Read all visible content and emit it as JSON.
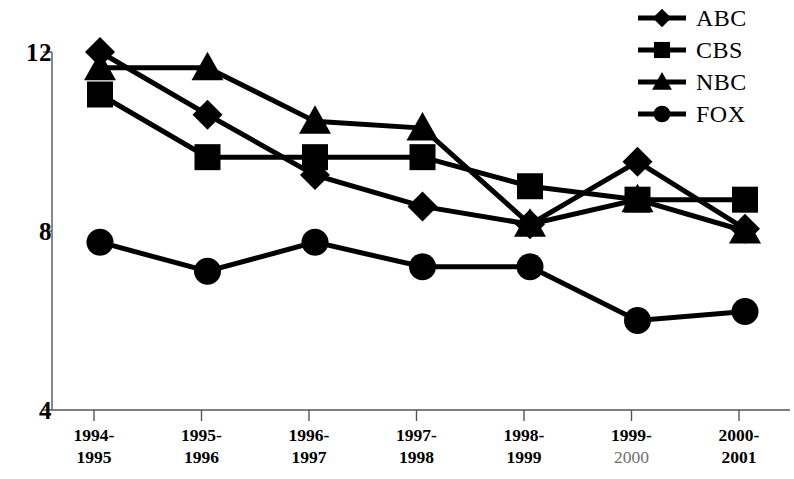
{
  "chart_data": {
    "type": "line",
    "title": "",
    "subtitle": "",
    "xlabel": "",
    "ylabel": "",
    "grid": false,
    "legend_position": "top-right",
    "ylim": [
      4,
      12
    ],
    "yticks": [
      4,
      8,
      12
    ],
    "ytick_labels": [
      "4",
      "8",
      "12"
    ],
    "categories": [
      "1994-1995",
      "1995-1996",
      "1996-1997",
      "1997-1998",
      "1998-1999",
      "1999-2000",
      "2000-2001"
    ],
    "category_lines": [
      {
        "line1": "1994-",
        "line2": "1995",
        "line2_light": false
      },
      {
        "line1": "1995-",
        "line2": "1996",
        "line2_light": false
      },
      {
        "line1": "1996-",
        "line2": "1997",
        "line2_light": false
      },
      {
        "line1": "1997-",
        "line2": "1998",
        "line2_light": false
      },
      {
        "line1": "1998-",
        "line2": "1999",
        "line2_light": false
      },
      {
        "line1": "1999-",
        "line2": "2000",
        "line2_light": true
      },
      {
        "line1": "2000-",
        "line2": "2001",
        "line2_light": false
      }
    ],
    "series": [
      {
        "name": "ABC",
        "marker": "diamond",
        "values": [
          12.0,
          10.6,
          9.25,
          8.55,
          8.15,
          9.55,
          8.05
        ]
      },
      {
        "name": "CBS",
        "marker": "square",
        "values": [
          11.05,
          9.65,
          9.65,
          9.65,
          9.0,
          8.7,
          8.7
        ]
      },
      {
        "name": "NBC",
        "marker": "triangle",
        "values": [
          11.65,
          11.65,
          10.45,
          10.3,
          8.15,
          8.7,
          8.0
        ]
      },
      {
        "name": "FOX",
        "marker": "circle",
        "values": [
          7.75,
          7.1,
          7.75,
          7.2,
          7.2,
          6.0,
          6.2
        ]
      }
    ],
    "colors": {
      "series": "#000000",
      "axis": "#555555",
      "background": "#ffffff"
    }
  },
  "legend": {
    "items": [
      {
        "label": "ABC",
        "marker": "diamond"
      },
      {
        "label": "CBS",
        "marker": "square"
      },
      {
        "label": "NBC",
        "marker": "triangle"
      },
      {
        "label": "FOX",
        "marker": "circle"
      }
    ]
  },
  "axes": {
    "y": {
      "labels": [
        "12",
        "8",
        "4"
      ]
    }
  }
}
